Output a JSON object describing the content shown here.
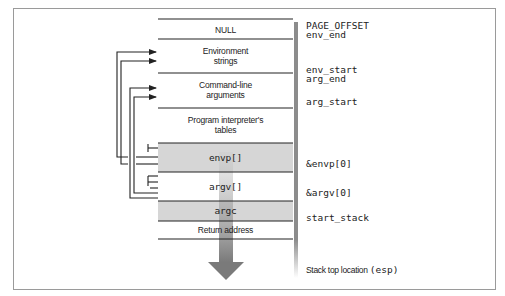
{
  "diagram": {
    "cells": [
      {
        "label": "NULL",
        "shaded": false
      },
      {
        "label": "Environment strings",
        "line1": "Environment",
        "line2": "strings",
        "shaded": false
      },
      {
        "label": "Command-line arguments",
        "line1": "Command-line",
        "line2": "arguments",
        "shaded": false
      },
      {
        "label": "Program interpreter's tables",
        "line1": "Program interpreter's",
        "line2": "tables",
        "shaded": false
      },
      {
        "label": "envp[]",
        "shaded": true
      },
      {
        "label": "argv[]",
        "shaded": false
      },
      {
        "label": "argc",
        "shaded": true
      },
      {
        "label": "Return address",
        "shaded": false
      }
    ],
    "side_labels": {
      "page_offset": "PAGE_OFFSET",
      "env_end": "env_end",
      "env_start": "env_start",
      "arg_end": "arg_end",
      "arg_start": "arg_start",
      "envp0": "&envp[0]",
      "argv0": "&argv[0]",
      "start_stack": "start_stack",
      "stack_top_text": "Stack top location ",
      "stack_top_reg": "(esp)"
    },
    "colors": {
      "shaded_cell": "#d6d6d6",
      "line": "#222222",
      "arrow": "#8a8a8a",
      "frame": "#9a9a9a"
    }
  }
}
